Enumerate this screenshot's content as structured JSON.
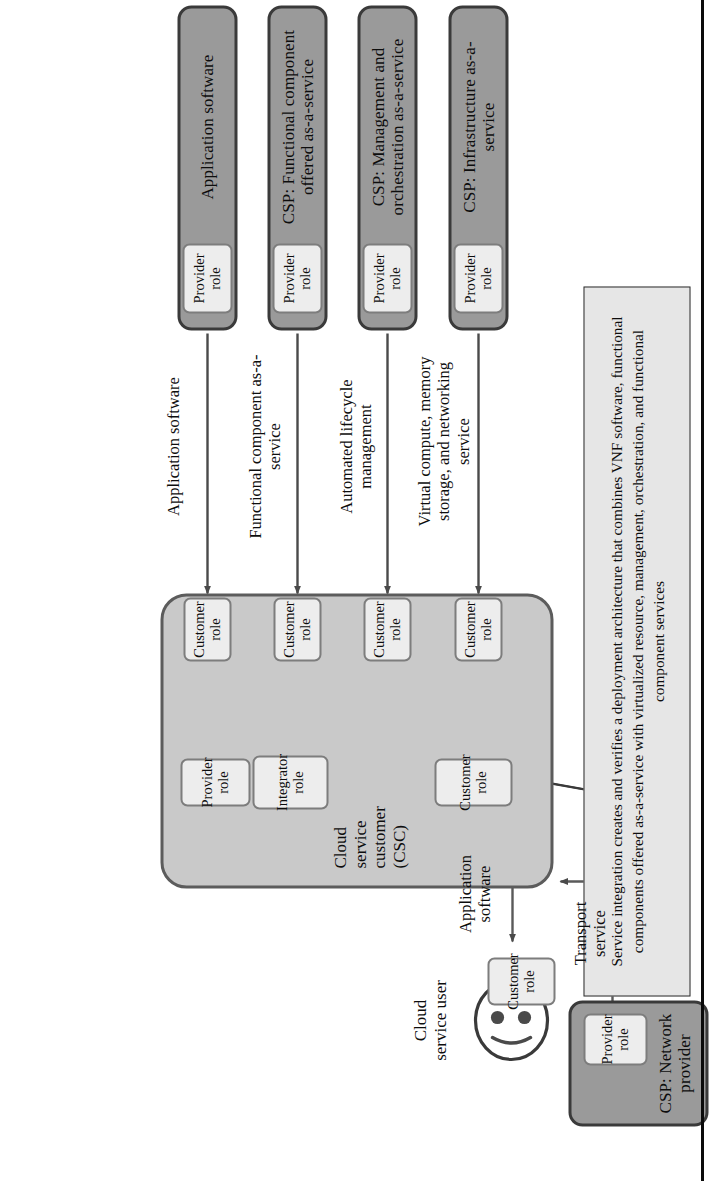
{
  "figure": {
    "colors": {
      "provider_fill": "#9a9a9a",
      "provider_stroke": "#3a3a3a",
      "csc_fill": "#c9c9c9",
      "csc_stroke": "#5c5c5c",
      "chip_fill": "#ededed",
      "chip_stroke": "#7d7d7d",
      "callout_fill": "#e6e6e6",
      "line": "#4a4a4a"
    }
  },
  "callout": {
    "text": "Service integration creates and verifies a deployment architecture that combines VNF software, functional components offered as-a-service with virtualized resource, management, orchestration, and functional component services"
  },
  "providers": [
    {
      "id": "application-software",
      "title": "Application software",
      "role_label": "Provider\nrole",
      "role_label_line1": "Provider",
      "role_label_line2": "role"
    },
    {
      "id": "csp-functional-component",
      "title": "CSP: Functional component offered as-a-service",
      "role_label_line1": "Provider",
      "role_label_line2": "role"
    },
    {
      "id": "csp-management-orchestration",
      "title": "CSP: Management and orchestration as-a-service",
      "role_label_line1": "Provider",
      "role_label_line2": "role"
    },
    {
      "id": "csp-infrastructure",
      "title": "CSP: Infrastructure as-a-service",
      "role_label_line1": "Provider",
      "role_label_line2": "role"
    }
  ],
  "network_provider": {
    "id": "csp-network-provider",
    "title": "CSP: Network provider",
    "role_label_line1": "Provider",
    "role_label_line2": "role"
  },
  "edge_labels": {
    "application_software": "Application software",
    "functional_component": "Functional component as-a-service",
    "automated_lifecycle": "Automated lifecycle management",
    "virtual_compute": "Virtual compute, memory storage, and networking service",
    "user_application_software": "Application software",
    "transport_service": "Transport service"
  },
  "csc": {
    "label": "Cloud service customer (CSC)",
    "customer_roles": [
      {
        "line1": "Customer",
        "line2": "role"
      },
      {
        "line1": "Customer",
        "line2": "role"
      },
      {
        "line1": "Customer",
        "line2": "role"
      },
      {
        "line1": "Customer",
        "line2": "role"
      }
    ],
    "provider_role": {
      "line1": "Provider",
      "line2": "role"
    },
    "integrator_role": {
      "line1": "Integrator",
      "line2": "role"
    },
    "bottom_customer_role": {
      "line1": "Customer",
      "line2": "role"
    }
  },
  "cloud_service_user": {
    "label": "Cloud service user",
    "customer_role": {
      "line1": "Customer",
      "line2": "role"
    },
    "icon": "smiley-face-icon"
  }
}
